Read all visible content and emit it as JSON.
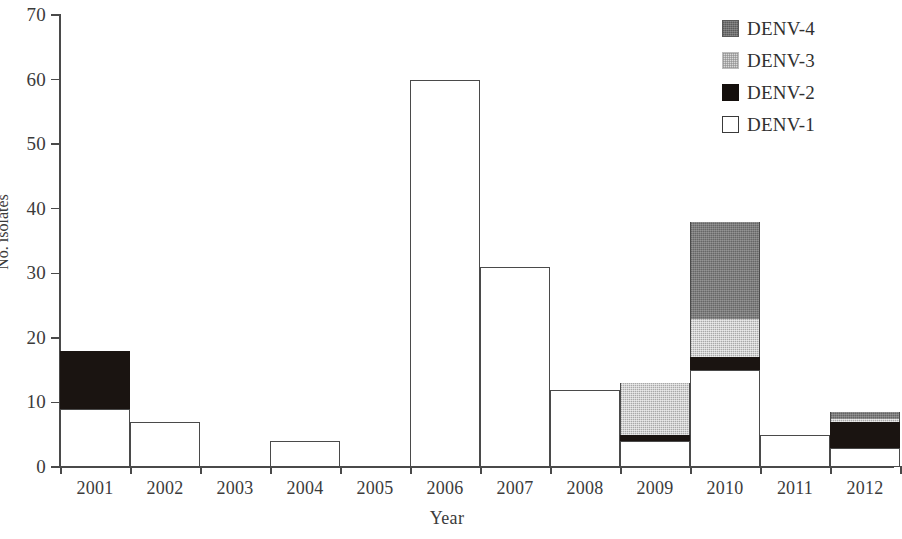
{
  "chart_data": {
    "type": "bar",
    "subtype": "stacked",
    "title": "",
    "xlabel": "Year",
    "ylabel": "No. isolates",
    "categories": [
      "2001",
      "2002",
      "2003",
      "2004",
      "2005",
      "2006",
      "2007",
      "2008",
      "2009",
      "2010",
      "2011",
      "2012"
    ],
    "series": [
      {
        "name": "DENV-1",
        "color": "#ffffff",
        "values": [
          9,
          7,
          0,
          4,
          0,
          60,
          31,
          12,
          4,
          15,
          5,
          3
        ]
      },
      {
        "name": "DENV-2",
        "color": "#140f0c",
        "values": [
          9,
          0,
          0,
          0,
          0,
          0,
          0,
          0,
          1,
          2,
          0,
          4
        ]
      },
      {
        "name": "DENV-3",
        "color": "#d8d8d8",
        "values": [
          0,
          0,
          0,
          0,
          0,
          0,
          0,
          0,
          8,
          6,
          0,
          0.5
        ]
      },
      {
        "name": "DENV-4",
        "color": "#6f6f6f",
        "values": [
          0,
          0,
          0,
          0,
          0,
          0,
          0,
          0,
          0,
          15,
          0,
          1
        ]
      }
    ],
    "totals": [
      18,
      7,
      0,
      4,
      0,
      60,
      31,
      12,
      13,
      38,
      5,
      8.5
    ],
    "ylim": [
      0,
      70
    ],
    "ytick_values": [
      0,
      10,
      20,
      30,
      40,
      50,
      60,
      70
    ],
    "ytick_labels": [
      "0",
      "10",
      "20",
      "30",
      "40",
      "50",
      "60",
      "70"
    ],
    "grid": false,
    "legend_position": "top-right",
    "note": "rightmost bar (2012) is clipped by the right edge of the figure"
  },
  "axes": {
    "y_title": "No. isolates",
    "x_title": "Year",
    "y_ticks": [
      "70",
      "60",
      "50",
      "40",
      "30",
      "20",
      "10",
      "0"
    ],
    "x_ticks": [
      "2001",
      "2002",
      "2003",
      "2004",
      "2005",
      "2006",
      "2007",
      "2008",
      "2009",
      "2010",
      "2011",
      "2012"
    ]
  },
  "legend": {
    "items": [
      {
        "label": "DENV-4",
        "swatch": "denv4-swatch"
      },
      {
        "label": "DENV-3",
        "swatch": "denv3-swatch"
      },
      {
        "label": "DENV-2",
        "swatch": "denv2-swatch"
      },
      {
        "label": "DENV-1",
        "swatch": "denv1-swatch"
      }
    ]
  }
}
